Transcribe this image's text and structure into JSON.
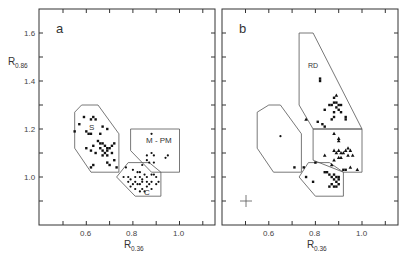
{
  "figure": {
    "panels": [
      {
        "id": "a",
        "label": "a"
      },
      {
        "id": "b",
        "label": "b"
      }
    ],
    "y_axis": {
      "label_main": "R",
      "label_sub": "0.86",
      "ticks": [
        "1.6",
        "1.4",
        "1.2",
        "1.0"
      ]
    },
    "x_axis": {
      "label_main": "R",
      "label_sub": "0.36",
      "ticks": [
        "0.6",
        "0.8",
        "1.0"
      ]
    },
    "regions": {
      "S": "S",
      "MPM": "M - PM",
      "C": "C",
      "RD": "RD"
    },
    "error_bar_icon": "crosshair-error-bar"
  },
  "chart_data": [
    {
      "type": "scatter",
      "panel": "a",
      "title": "a",
      "xlabel": "R0.36",
      "ylabel": "R0.86",
      "xlim": [
        0.4,
        1.15
      ],
      "ylim": [
        0.8,
        1.7
      ],
      "x_ticks": [
        0.6,
        0.8,
        1.0
      ],
      "y_ticks": [
        1.0,
        1.2,
        1.4,
        1.6
      ],
      "grid": false,
      "regions": [
        {
          "name": "S",
          "polygon": [
            [
              0.55,
              1.27
            ],
            [
              0.58,
              1.3
            ],
            [
              0.65,
              1.3
            ],
            [
              0.74,
              1.18
            ],
            [
              0.74,
              1.02
            ],
            [
              0.62,
              1.02
            ],
            [
              0.55,
              1.12
            ]
          ]
        },
        {
          "name": "M - PM",
          "polygon": [
            [
              0.79,
              1.2
            ],
            [
              1.0,
              1.2
            ],
            [
              1.0,
              1.02
            ],
            [
              0.88,
              1.02
            ],
            [
              0.79,
              1.11
            ]
          ]
        },
        {
          "name": "C",
          "polygon": [
            [
              0.78,
              1.06
            ],
            [
              0.87,
              1.06
            ],
            [
              0.92,
              1.02
            ],
            [
              0.92,
              0.92
            ],
            [
              0.81,
              0.92
            ],
            [
              0.73,
              1.0
            ]
          ]
        }
      ],
      "series": [
        {
          "name": "S",
          "marker": "square",
          "points": [
            [
              0.59,
              1.25
            ],
            [
              0.62,
              1.24
            ],
            [
              0.63,
              1.25
            ],
            [
              0.64,
              1.24
            ],
            [
              0.57,
              1.22
            ],
            [
              0.67,
              1.21
            ],
            [
              0.55,
              1.19
            ],
            [
              0.6,
              1.19
            ],
            [
              0.61,
              1.18
            ],
            [
              0.62,
              1.18
            ],
            [
              0.66,
              1.18
            ],
            [
              0.69,
              1.2
            ],
            [
              0.65,
              1.15
            ],
            [
              0.66,
              1.14
            ],
            [
              0.67,
              1.14
            ],
            [
              0.68,
              1.13
            ],
            [
              0.69,
              1.12
            ],
            [
              0.7,
              1.12
            ],
            [
              0.66,
              1.12
            ],
            [
              0.67,
              1.11
            ],
            [
              0.68,
              1.1
            ],
            [
              0.69,
              1.11
            ],
            [
              0.71,
              1.13
            ],
            [
              0.72,
              1.14
            ],
            [
              0.63,
              1.13
            ],
            [
              0.62,
              1.11
            ],
            [
              0.64,
              1.1
            ],
            [
              0.67,
              1.09
            ],
            [
              0.69,
              1.09
            ],
            [
              0.6,
              1.12
            ],
            [
              0.71,
              1.1
            ],
            [
              0.72,
              1.07
            ],
            [
              0.63,
              1.05
            ],
            [
              0.69,
              1.06
            ],
            [
              0.7,
              1.05
            ],
            [
              0.73,
              1.04
            ],
            [
              0.62,
              1.04
            ]
          ]
        },
        {
          "name": "M - PM",
          "marker": "dot",
          "points": [
            [
              0.88,
              1.18
            ],
            [
              0.86,
              1.09
            ],
            [
              0.88,
              1.1
            ],
            [
              0.89,
              1.09
            ],
            [
              0.86,
              1.07
            ],
            [
              0.87,
              1.06
            ],
            [
              0.89,
              1.06
            ],
            [
              0.84,
              1.05
            ],
            [
              0.95,
              1.09
            ],
            [
              0.94,
              1.08
            ]
          ]
        },
        {
          "name": "C",
          "marker": "dot",
          "points": [
            [
              0.77,
              1.04
            ],
            [
              0.8,
              1.03
            ],
            [
              0.82,
              1.02
            ],
            [
              0.83,
              1.02
            ],
            [
              0.76,
              1.0
            ],
            [
              0.78,
              1.0
            ],
            [
              0.79,
              0.99
            ],
            [
              0.81,
              1.0
            ],
            [
              0.83,
              1.0
            ],
            [
              0.84,
              0.99
            ],
            [
              0.85,
              1.01
            ],
            [
              0.86,
              1.0
            ],
            [
              0.88,
              1.01
            ],
            [
              0.89,
              1.01
            ],
            [
              0.9,
              1.0
            ],
            [
              0.78,
              0.98
            ],
            [
              0.8,
              0.97
            ],
            [
              0.81,
              0.98
            ],
            [
              0.82,
              0.97
            ],
            [
              0.83,
              0.97
            ],
            [
              0.84,
              0.98
            ],
            [
              0.86,
              0.98
            ],
            [
              0.87,
              0.97
            ],
            [
              0.88,
              0.98
            ],
            [
              0.9,
              0.97
            ],
            [
              0.91,
              0.98
            ],
            [
              0.79,
              0.96
            ],
            [
              0.81,
              0.95
            ],
            [
              0.84,
              0.95
            ],
            [
              0.86,
              0.96
            ],
            [
              0.88,
              0.95
            ],
            [
              0.83,
              0.94
            ],
            [
              0.85,
              0.94
            ]
          ]
        }
      ]
    },
    {
      "type": "scatter",
      "panel": "b",
      "title": "b",
      "xlabel": "R0.36",
      "ylabel": "R0.86",
      "xlim": [
        0.4,
        1.15
      ],
      "ylim": [
        0.8,
        1.7
      ],
      "x_ticks": [
        0.6,
        0.8,
        1.0
      ],
      "y_ticks": [
        1.0,
        1.2,
        1.4,
        1.6
      ],
      "grid": false,
      "annotations": [
        "crosshair error bar at (0.5, 0.90)"
      ],
      "regions": [
        {
          "name": "S",
          "polygon": [
            [
              0.55,
              1.27
            ],
            [
              0.6,
              1.3
            ],
            [
              0.65,
              1.3
            ],
            [
              0.74,
              1.18
            ],
            [
              0.74,
              1.02
            ],
            [
              0.62,
              1.02
            ],
            [
              0.55,
              1.12
            ]
          ]
        },
        {
          "name": "RD",
          "polygon": [
            [
              0.73,
              1.6
            ],
            [
              0.79,
              1.6
            ],
            [
              1.0,
              1.2
            ],
            [
              0.79,
              1.2
            ],
            [
              0.73,
              1.3
            ]
          ]
        },
        {
          "name": "M - PM",
          "polygon": [
            [
              0.79,
              1.2
            ],
            [
              1.0,
              1.2
            ],
            [
              1.0,
              1.02
            ],
            [
              0.92,
              1.02
            ],
            [
              0.79,
              1.07
            ]
          ]
        },
        {
          "name": "C",
          "polygon": [
            [
              0.77,
              1.06
            ],
            [
              0.86,
              1.06
            ],
            [
              0.92,
              1.02
            ],
            [
              0.92,
              0.92
            ],
            [
              0.8,
              0.92
            ],
            [
              0.73,
              1.0
            ]
          ]
        }
      ],
      "series": [
        {
          "name": "RD",
          "marker": "square",
          "points": [
            [
              0.82,
              1.41
            ],
            [
              0.82,
              1.4
            ],
            [
              0.88,
              1.33
            ],
            [
              0.86,
              1.3
            ],
            [
              0.87,
              1.3
            ],
            [
              0.88,
              1.31
            ],
            [
              0.89,
              1.31
            ],
            [
              0.9,
              1.3
            ],
            [
              0.91,
              1.3
            ],
            [
              0.89,
              1.29
            ],
            [
              0.9,
              1.28
            ],
            [
              0.84,
              1.28
            ],
            [
              0.88,
              1.27
            ],
            [
              0.91,
              1.27
            ],
            [
              0.87,
              1.24
            ],
            [
              0.88,
              1.25
            ],
            [
              0.93,
              1.25
            ],
            [
              0.93,
              1.24
            ],
            [
              0.81,
              1.23
            ],
            [
              0.83,
              1.22
            ],
            [
              0.84,
              1.21
            ]
          ]
        },
        {
          "name": "RD",
          "marker": "triangle",
          "points": [
            [
              0.76,
              1.24
            ],
            [
              0.89,
              1.34
            ]
          ]
        },
        {
          "name": "M - PM",
          "marker": "triangle",
          "points": [
            [
              0.88,
              1.18
            ],
            [
              0.9,
              1.16
            ],
            [
              0.9,
              1.15
            ],
            [
              0.84,
              1.09
            ],
            [
              0.88,
              1.11
            ],
            [
              0.89,
              1.1
            ],
            [
              0.9,
              1.11
            ],
            [
              0.91,
              1.1
            ],
            [
              0.92,
              1.1
            ],
            [
              0.93,
              1.11
            ],
            [
              0.94,
              1.12
            ],
            [
              0.96,
              1.09
            ],
            [
              0.9,
              1.08
            ],
            [
              0.91,
              1.08
            ],
            [
              0.94,
              1.09
            ],
            [
              0.95,
              1.11
            ],
            [
              0.88,
              1.07
            ],
            [
              0.87,
              1.05
            ],
            [
              0.95,
              1.04
            ],
            [
              0.98,
              1.03
            ]
          ]
        },
        {
          "name": "C",
          "marker": "square",
          "points": [
            [
              0.75,
              1.04
            ],
            [
              0.8,
              1.06
            ],
            [
              0.84,
              1.02
            ],
            [
              0.85,
              1.02
            ],
            [
              0.86,
              1.01
            ],
            [
              0.87,
              1.0
            ],
            [
              0.88,
              1.01
            ],
            [
              0.89,
              1.0
            ],
            [
              0.9,
              1.0
            ],
            [
              0.9,
              0.99
            ],
            [
              0.88,
              0.99
            ],
            [
              0.89,
              0.98
            ],
            [
              0.9,
              0.97
            ],
            [
              0.87,
              0.97
            ],
            [
              0.88,
              0.96
            ],
            [
              0.89,
              0.96
            ],
            [
              0.86,
              0.96
            ],
            [
              0.79,
              0.98
            ],
            [
              0.92,
              1.03
            ],
            [
              0.93,
              1.03
            ],
            [
              0.71,
              1.04
            ],
            [
              0.76,
              1.0
            ]
          ]
        },
        {
          "name": "S",
          "marker": "dot",
          "points": [
            [
              0.65,
              1.17
            ]
          ]
        }
      ]
    }
  ]
}
